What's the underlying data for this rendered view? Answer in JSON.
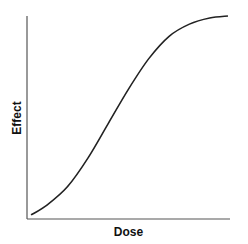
{
  "chart_data": {
    "type": "line",
    "title": "",
    "xlabel": "Dose",
    "ylabel": "Effect",
    "grid": false,
    "legend": null,
    "xlim": [
      0,
      1
    ],
    "ylim": [
      0,
      1
    ],
    "ticks": false,
    "series": [
      {
        "name": "dose-response",
        "shape": "sigmoid",
        "x": [
          0.02,
          0.1,
          0.2,
          0.3,
          0.4,
          0.5,
          0.6,
          0.7,
          0.8,
          0.9,
          0.99
        ],
        "y": [
          0.02,
          0.07,
          0.16,
          0.3,
          0.47,
          0.64,
          0.79,
          0.9,
          0.96,
          0.99,
          1.0
        ]
      }
    ]
  },
  "colors": {
    "axis": "#555555",
    "line": "#222222"
  }
}
